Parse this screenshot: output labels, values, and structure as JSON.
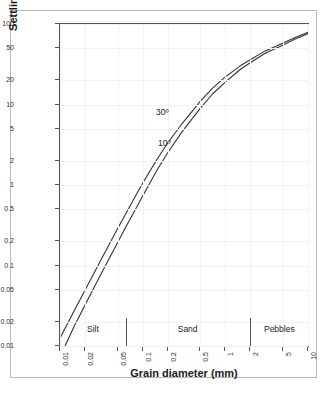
{
  "chart_data": {
    "type": "line",
    "title": "",
    "xlabel": "Grain diameter (mm)",
    "ylabel": "Settling velocity (cm/s)",
    "xscale": "log",
    "yscale": "log",
    "xlim": [
      0.01,
      10
    ],
    "ylim": [
      0.01,
      100
    ],
    "grid": true,
    "legend_position": "inline-annotation",
    "xticks": [
      0.01,
      0.02,
      0.05,
      0.1,
      0.2,
      0.5,
      1,
      2,
      5,
      10
    ],
    "xtick_labels": [
      "0.01",
      "0.02",
      "0.05",
      "0.1",
      "0.2",
      "0.5",
      "1",
      "2",
      "5",
      "10"
    ],
    "yticks": [
      0.01,
      0.02,
      0.05,
      0.1,
      0.2,
      0.5,
      1,
      2,
      5,
      10,
      20,
      50,
      100
    ],
    "ytick_labels": [
      "0.01",
      "0.02",
      "0.05",
      "0.1",
      "0.2",
      "0.5",
      "1",
      "2",
      "5",
      "10",
      "20",
      "50",
      "100"
    ],
    "series": [
      {
        "name": "30º",
        "label": "30º",
        "color": "#333333",
        "points": [
          [
            0.01,
            0.0125
          ],
          [
            0.015,
            0.028
          ],
          [
            0.02,
            0.049
          ],
          [
            0.03,
            0.108
          ],
          [
            0.05,
            0.29
          ],
          [
            0.0625,
            0.44
          ],
          [
            0.08,
            0.7
          ],
          [
            0.1,
            1.05
          ],
          [
            0.15,
            2.1
          ],
          [
            0.2,
            3.3
          ],
          [
            0.3,
            5.8
          ],
          [
            0.5,
            11.0
          ],
          [
            0.7,
            16.0
          ],
          [
            1.0,
            22.0
          ],
          [
            1.5,
            30.0
          ],
          [
            2.0,
            36.0
          ],
          [
            3.0,
            46.0
          ],
          [
            5.0,
            58.0
          ],
          [
            7.0,
            68.0
          ],
          [
            10.0,
            79.0
          ]
        ]
      },
      {
        "name": "10º",
        "label": "10º",
        "color": "#333333",
        "points": [
          [
            0.0115,
            0.01
          ],
          [
            0.015,
            0.018
          ],
          [
            0.02,
            0.032
          ],
          [
            0.03,
            0.072
          ],
          [
            0.05,
            0.195
          ],
          [
            0.0625,
            0.3
          ],
          [
            0.08,
            0.48
          ],
          [
            0.1,
            0.73
          ],
          [
            0.15,
            1.55
          ],
          [
            0.2,
            2.5
          ],
          [
            0.3,
            4.6
          ],
          [
            0.5,
            9.0
          ],
          [
            0.7,
            13.5
          ],
          [
            1.0,
            19.0
          ],
          [
            1.5,
            27.0
          ],
          [
            2.0,
            33.0
          ],
          [
            3.0,
            43.0
          ],
          [
            5.0,
            55.0
          ],
          [
            7.0,
            65.0
          ],
          [
            10.0,
            76.0
          ]
        ]
      }
    ],
    "zones": [
      {
        "label": "Silt",
        "start": 0.01,
        "end": 0.0625,
        "center": 0.025
      },
      {
        "label": "Sand",
        "start": 0.0625,
        "end": 2.0,
        "center": 0.35
      },
      {
        "label": "Pebbles",
        "start": 2.0,
        "end": 10.0,
        "center": 4.5
      }
    ],
    "zone_dividers": [
      0.0625,
      2.0
    ],
    "zone_band_top": 0.0225
  },
  "axes": {
    "x_title": "Grain diameter (mm)",
    "y_title": "Settling velocity (cm/s)"
  },
  "colors": {
    "curve": "#333333",
    "axis": "#555555",
    "grid": "#f2f2f2",
    "frame": "#b9b9b9",
    "text": "#1a1a1a"
  }
}
